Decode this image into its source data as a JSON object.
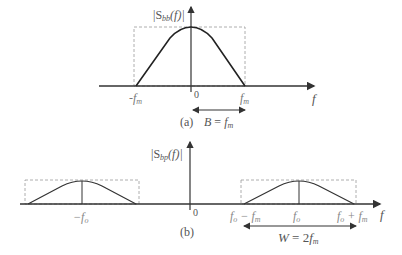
{
  "panels": [
    {
      "id": "a",
      "caption": "(a)",
      "y_label": {
        "base": "|S",
        "sub": "bb",
        "rest": "(f)|"
      },
      "x_label": "f",
      "origin_label": "0",
      "ticks": [
        {
          "base": "-f",
          "sub": "m"
        },
        {
          "base": "f",
          "sub": "m"
        }
      ],
      "bandwidth": {
        "lhs": "B",
        "eq": " = ",
        "base": "f",
        "sub": "m"
      }
    },
    {
      "id": "b",
      "caption": "(b)",
      "y_label": {
        "base": "|S",
        "sub": "bp",
        "rest": "(f)|"
      },
      "x_label": "f",
      "origin_label": "0",
      "ticks": [
        {
          "base": "−f",
          "sub": "o"
        },
        {
          "base": "f",
          "sub": "o",
          "rest": " − f",
          "sub2": "m"
        },
        {
          "base": "f",
          "sub": "o"
        },
        {
          "base": "f",
          "sub": "o",
          "rest": " + f",
          "sub2": "m"
        }
      ],
      "bandwidth": {
        "lhs": "W",
        "eq": " = 2",
        "base": "f",
        "sub": "m"
      }
    }
  ],
  "colors": {
    "line": "#333333",
    "dash": "#999999",
    "text": "#555555"
  }
}
